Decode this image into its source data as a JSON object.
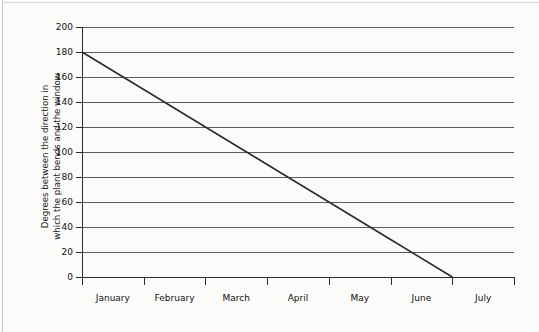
{
  "chart_data": {
    "type": "line",
    "title": "",
    "xlabel": "",
    "ylabel": "Degrees between the direction in which the plant bends and the window",
    "ylabel_line1": "Degrees between the direction in",
    "ylabel_line2": "which the plant bends and the window",
    "categories": [
      "January",
      "February",
      "March",
      "April",
      "May",
      "June",
      "July"
    ],
    "x": [
      "January",
      "February",
      "March",
      "April",
      "May",
      "June",
      "July"
    ],
    "values": [
      180,
      150,
      120,
      90,
      60,
      30,
      0
    ],
    "series": [
      {
        "name": "Degrees of bend",
        "values": [
          180,
          150,
          120,
          90,
          60,
          30,
          0
        ]
      }
    ],
    "ylim": [
      0,
      200
    ],
    "yticks": [
      0,
      20,
      40,
      60,
      80,
      100,
      120,
      140,
      160,
      180,
      200
    ],
    "ytick_labels": [
      "0",
      "20",
      "40",
      "60",
      "80",
      "100",
      "120",
      "140",
      "160",
      "180",
      "200"
    ],
    "grid": "horizontal",
    "legend": "none",
    "line_color": "#2b2b2b",
    "axis_color": "#2b2b2b",
    "grid_color": "#5b5b5b",
    "background": "#fbfbfa",
    "annotations": []
  }
}
